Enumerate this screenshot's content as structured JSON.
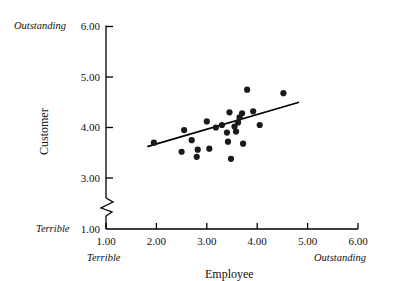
{
  "chart_data": {
    "type": "scatter",
    "title": "",
    "xlabel": "Employee",
    "ylabel": "Customer",
    "xlim": [
      1.0,
      6.0
    ],
    "ylim": [
      1.0,
      6.0
    ],
    "grid": false,
    "legend": null,
    "y_axis_break": true,
    "y_axis_break_between": [
      1.0,
      3.0
    ],
    "x_ticks": [
      "1.00",
      "2.00",
      "3.00",
      "4.00",
      "5.00",
      "6.00"
    ],
    "x_tick_values": [
      1.0,
      2.0,
      3.0,
      4.0,
      5.0,
      6.0
    ],
    "y_ticks": [
      "1.00",
      "3.00",
      "4.00",
      "5.00",
      "6.00"
    ],
    "y_tick_values": [
      1.0,
      3.0,
      4.0,
      5.0,
      6.0
    ],
    "x_anchor_low": "Terrible",
    "x_anchor_high": "Outstanding",
    "y_anchor_low": "Terrible",
    "y_anchor_high": "Outstanding",
    "marker_color": "#1a1a1a",
    "line_color": "#000000",
    "axis_color": "#000000",
    "points": [
      {
        "x": 1.95,
        "y": 3.7
      },
      {
        "x": 2.5,
        "y": 3.52
      },
      {
        "x": 2.55,
        "y": 3.95
      },
      {
        "x": 2.7,
        "y": 3.75
      },
      {
        "x": 2.8,
        "y": 3.42
      },
      {
        "x": 2.82,
        "y": 3.56
      },
      {
        "x": 3.0,
        "y": 4.12
      },
      {
        "x": 3.05,
        "y": 3.58
      },
      {
        "x": 3.18,
        "y": 4.0
      },
      {
        "x": 3.4,
        "y": 3.9
      },
      {
        "x": 3.42,
        "y": 3.72
      },
      {
        "x": 3.45,
        "y": 4.3
      },
      {
        "x": 3.48,
        "y": 3.38
      },
      {
        "x": 3.55,
        "y": 4.02
      },
      {
        "x": 3.58,
        "y": 3.92
      },
      {
        "x": 3.62,
        "y": 4.1
      },
      {
        "x": 3.65,
        "y": 4.2
      },
      {
        "x": 3.7,
        "y": 4.28
      },
      {
        "x": 3.72,
        "y": 3.68
      },
      {
        "x": 3.8,
        "y": 4.75
      },
      {
        "x": 3.92,
        "y": 4.32
      },
      {
        "x": 4.05,
        "y": 4.05
      },
      {
        "x": 4.52,
        "y": 4.68
      },
      {
        "x": 3.3,
        "y": 4.05
      }
    ],
    "regression_line": {
      "x_start": 1.82,
      "y_start": 3.62,
      "x_end": 4.83,
      "y_end": 4.5
    }
  }
}
